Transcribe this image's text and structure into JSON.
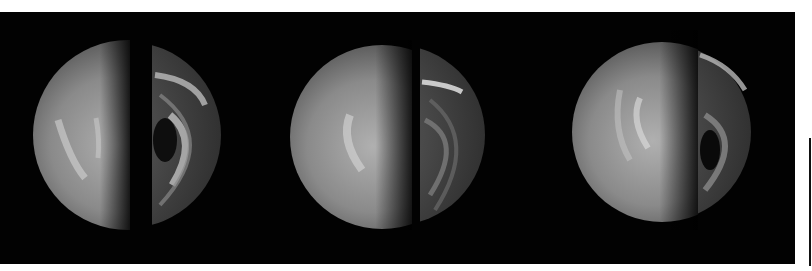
{
  "figure": {
    "background_color": "#020202",
    "page_color": "#ffffff",
    "panels": [
      {
        "index": 1,
        "left_hemisphere": "uv-dayside",
        "right_hemisphere": "ir-nightside-vortex"
      },
      {
        "index": 2,
        "left_hemisphere": "uv-dayside",
        "right_hemisphere": "ir-nightside-vortex"
      },
      {
        "index": 3,
        "left_hemisphere": "uv-dayside",
        "right_hemisphere": "ir-nightside-vortex"
      }
    ]
  }
}
